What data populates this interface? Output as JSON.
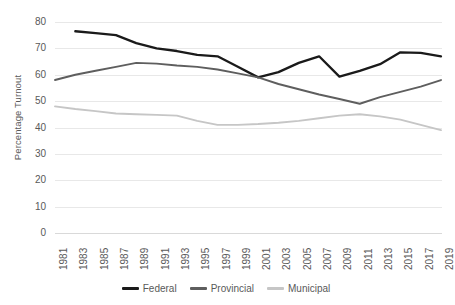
{
  "chart_data": {
    "type": "line",
    "title": "",
    "xlabel": "",
    "ylabel": "Percentage Turnout",
    "ylim": [
      0,
      80
    ],
    "yticks": [
      0,
      10,
      20,
      30,
      40,
      50,
      60,
      70,
      80
    ],
    "grid": true,
    "legend_position": "bottom",
    "x": [
      1981,
      1983,
      1985,
      1987,
      1989,
      1991,
      1993,
      1995,
      1997,
      1999,
      2001,
      2003,
      2005,
      2007,
      2009,
      2011,
      2013,
      2015,
      2017,
      2019
    ],
    "xtick_labels": [
      "1981",
      "1983",
      "1985",
      "1987",
      "1989",
      "1991",
      "1993",
      "1995",
      "1997",
      "1999",
      "2001",
      "2003",
      "2005",
      "2007",
      "2009",
      "2011",
      "2013",
      "2015",
      "2017",
      "2019"
    ],
    "series": [
      {
        "name": "Federal",
        "color": "#1a1a1a",
        "values": [
          null,
          76.5,
          75.8,
          75.0,
          72.0,
          70.0,
          69.0,
          67.5,
          67.0,
          63.0,
          59.0,
          61.0,
          64.5,
          67.0,
          59.3,
          61.5,
          64.0,
          68.5,
          68.3,
          67.0
        ]
      },
      {
        "name": "Provincial",
        "color": "#5e5e5e",
        "values": [
          58.0,
          60.0,
          61.5,
          63.0,
          64.5,
          64.2,
          63.5,
          63.0,
          62.0,
          60.5,
          59.0,
          56.5,
          54.5,
          52.5,
          50.8,
          49.0,
          51.5,
          53.5,
          55.5,
          58.0
        ]
      },
      {
        "name": "Municipal",
        "color": "#c6c6c6",
        "values": [
          48.0,
          47.0,
          46.2,
          45.3,
          45.0,
          44.8,
          44.5,
          42.5,
          41.0,
          41.0,
          41.3,
          41.8,
          42.5,
          43.5,
          44.5,
          45.0,
          44.2,
          43.0,
          41.0,
          39.0
        ]
      }
    ]
  },
  "axis": {
    "y_title": "Percentage Turnout"
  },
  "legend": {
    "items": [
      {
        "label": "Federal",
        "color": "#1a1a1a"
      },
      {
        "label": "Provincial",
        "color": "#5e5e5e"
      },
      {
        "label": "Municipal",
        "color": "#c6c6c6"
      }
    ]
  }
}
